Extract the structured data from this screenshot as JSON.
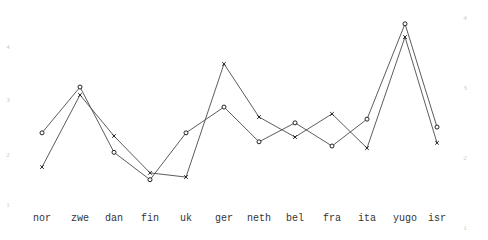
{
  "chart_data": {
    "type": "line",
    "title": "",
    "xlabel": "",
    "ylabel": "",
    "categories": [
      "nor",
      "zwe",
      "dan",
      "fin",
      "uk",
      "ger",
      "neth",
      "bel",
      "fra",
      "ita",
      "yugo",
      "isr"
    ],
    "category_x": [
      42,
      80,
      114,
      150,
      186,
      224,
      259,
      295,
      332,
      367,
      405,
      437
    ],
    "series": [
      {
        "name": "o",
        "marker": "circle",
        "values": [
          2.37,
          3.24,
          2.0,
          1.48,
          2.37,
          2.86,
          2.2,
          2.56,
          2.12,
          2.63,
          4.44,
          2.48
        ]
      },
      {
        "name": "x",
        "marker": "cross",
        "values": [
          1.72,
          3.09,
          2.31,
          1.61,
          1.53,
          3.68,
          2.67,
          2.29,
          2.73,
          2.08,
          4.19,
          2.18
        ]
      }
    ],
    "ylim": [
      1,
      4.5
    ],
    "left_axis_ticks": [
      {
        "label": "4",
        "y": 47
      },
      {
        "label": "3",
        "y": 100
      },
      {
        "label": "2",
        "y": 155
      },
      {
        "label": "1",
        "y": 205
      }
    ],
    "right_axis_ticks": [
      {
        "label": "4",
        "y": 18
      },
      {
        "label": "3",
        "y": 88
      },
      {
        "label": "2",
        "y": 158
      },
      {
        "label": "1",
        "y": 228
      }
    ],
    "grid": false,
    "legend": "none",
    "colors": {
      "line": "#4a4a4a",
      "tick": "#c8c8c8",
      "label": "#333333"
    }
  }
}
